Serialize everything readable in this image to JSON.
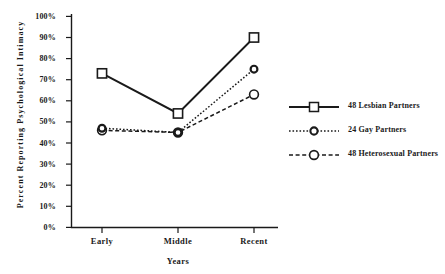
{
  "chart_data": {
    "type": "line",
    "title": "",
    "xlabel": "Years",
    "ylabel": "Percent Reporting Psychological Intimacy",
    "categories": [
      "Early",
      "Middle",
      "Recent"
    ],
    "ylim": [
      0,
      100
    ],
    "ytick_labels": [
      "0%",
      "10%",
      "20%",
      "30%",
      "40%",
      "50%",
      "60%",
      "70%",
      "80%",
      "90%",
      "100%"
    ],
    "ytick_values": [
      0,
      10,
      20,
      30,
      40,
      50,
      60,
      70,
      80,
      90,
      100
    ],
    "grid": false,
    "legend_position": "right",
    "units": "percent",
    "series": [
      {
        "name": "48 Lesbian Partners",
        "values": [
          73,
          54,
          90
        ],
        "marker": "open-square",
        "line_style": "solid",
        "color": "#1a1a1a"
      },
      {
        "name": "24 Gay Partners",
        "values": [
          47,
          45,
          75
        ],
        "marker": "small-open-circle",
        "line_style": "dotted",
        "color": "#1a1a1a"
      },
      {
        "name": "48 Heterosexual Partners",
        "values": [
          46,
          45,
          63
        ],
        "marker": "open-circle",
        "line_style": "dashed",
        "color": "#1a1a1a"
      }
    ]
  },
  "axes": {
    "y_title": "Percent  Reporting  Psychological  Intimacy",
    "x_title": "Years",
    "y_ticks": [
      {
        "label": "100%"
      },
      {
        "label": "90%"
      },
      {
        "label": "80%"
      },
      {
        "label": "70%"
      },
      {
        "label": "60%"
      },
      {
        "label": "50%"
      },
      {
        "label": "40%"
      },
      {
        "label": "30%"
      },
      {
        "label": "20%"
      },
      {
        "label": "10%"
      },
      {
        "label": "0%"
      }
    ],
    "x_ticks": [
      {
        "label": "Early"
      },
      {
        "label": "Middle"
      },
      {
        "label": "Recent"
      }
    ]
  },
  "legend": {
    "items": [
      {
        "label": "48 Lesbian Partners"
      },
      {
        "label": "24 Gay Partners"
      },
      {
        "label": "48 Heterosexual Partners"
      }
    ]
  }
}
